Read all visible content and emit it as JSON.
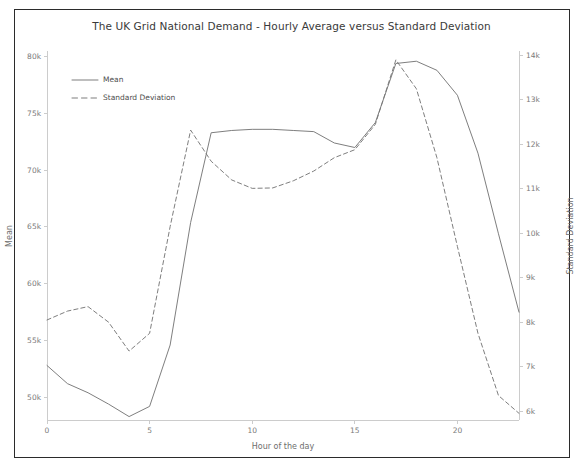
{
  "chart_data": {
    "type": "line",
    "title": "The UK Grid National Demand - Hourly Average versus Standard Deviation",
    "xlabel": "Hour of the day",
    "ylabel": "Mean",
    "y2label": "Standard Deviation",
    "grid": false,
    "legend_position": "upper left",
    "x": [
      0,
      1,
      2,
      3,
      4,
      5,
      6,
      7,
      8,
      9,
      10,
      11,
      12,
      13,
      14,
      15,
      16,
      17,
      18,
      19,
      20,
      21,
      22,
      23
    ],
    "xlim": [
      0,
      23
    ],
    "xticks": [
      0,
      5,
      10,
      15,
      20
    ],
    "xticklabels": [
      "0",
      "5",
      "10",
      "15",
      "20"
    ],
    "ylim": [
      48000,
      80500
    ],
    "yticks": [
      50000,
      55000,
      60000,
      65000,
      70000,
      75000,
      80000
    ],
    "yticklabels": [
      "50k",
      "55k",
      "60k",
      "65k",
      "70k",
      "75k",
      "80k"
    ],
    "y2lim": [
      5800,
      14100
    ],
    "y2ticks": [
      6000,
      7000,
      8000,
      9000,
      10000,
      11000,
      12000,
      13000,
      14000
    ],
    "y2ticklabels": [
      "6k",
      "7k",
      "8k",
      "9k",
      "10k",
      "11k",
      "12k",
      "13k",
      "14k"
    ],
    "series": [
      {
        "name": "Mean",
        "axis": "left",
        "style": "solid",
        "color": "#777777",
        "values": [
          52800,
          51200,
          50400,
          49400,
          48300,
          49200,
          54600,
          65400,
          73300,
          73500,
          73600,
          73600,
          73500,
          73400,
          72400,
          72000,
          74200,
          79400,
          79600,
          78800,
          76600,
          71500,
          64400,
          57500
        ]
      },
      {
        "name": "Standard Deviation",
        "axis": "right",
        "style": "dashed",
        "color": "#777777",
        "values": [
          8050,
          8250,
          8350,
          8000,
          7350,
          7750,
          10150,
          12320,
          11620,
          11200,
          11010,
          11020,
          11180,
          11400,
          11700,
          11880,
          12450,
          13900,
          13250,
          11700,
          9700,
          7750,
          6350,
          5950
        ]
      }
    ]
  },
  "legend": {
    "entries": [
      {
        "label": "Mean"
      },
      {
        "label": "Standard Deviation"
      }
    ]
  },
  "colors": {
    "line": "#777777",
    "axis": "#cccccc",
    "tick_text": "#7a7a7a",
    "title_text": "#3a3a3a",
    "frame": "#2b2b2b"
  }
}
